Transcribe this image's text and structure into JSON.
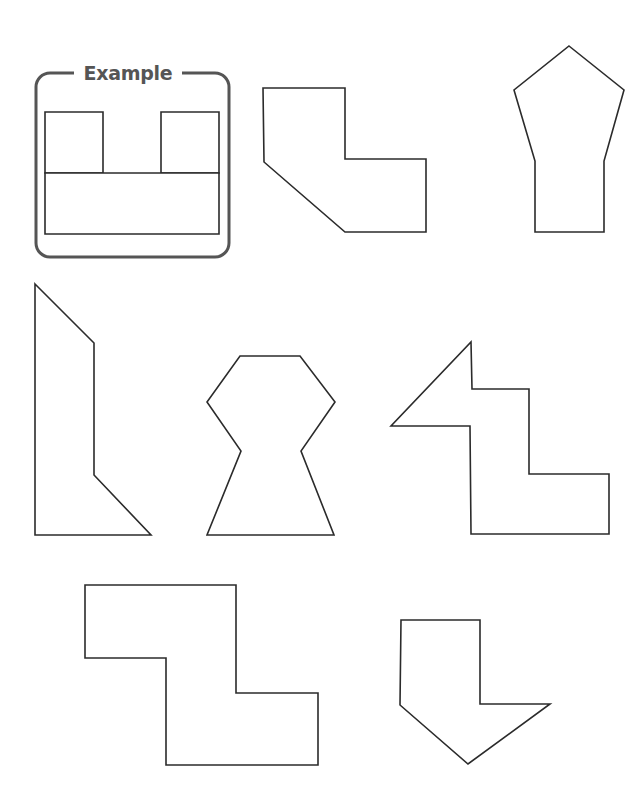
{
  "worksheet": {
    "example": {
      "title": "Example",
      "frame": {
        "x": 36,
        "y": 73,
        "width": 193,
        "height": 184,
        "radius": 14,
        "color": "#555555"
      },
      "pieces": [
        {
          "name": "left-square",
          "points": "45,112 103,112 103,173 45,173"
        },
        {
          "name": "right-square",
          "points": "161,112 219,112 219,173 161,173"
        },
        {
          "name": "bottom-rectangle",
          "points": "45,173 219,173 219,234 45,234"
        }
      ]
    },
    "shapes": [
      {
        "id": 1,
        "name": "shape-bent-l",
        "points": "263,88 345,88 345,159 426,159 426,232 345,232 264,162"
      },
      {
        "id": 2,
        "name": "shape-house",
        "points": "569,46 624,90 604,161 604,232 535,232 535,161 514,90"
      },
      {
        "id": 3,
        "name": "shape-tall-slant",
        "points": "35,284 94,343 94,475 151,535 35,535"
      },
      {
        "id": 4,
        "name": "shape-keyhole",
        "points": "240,356 300,356 335,402 301,451 334,535 207,535 241,451 207,402"
      },
      {
        "id": 5,
        "name": "shape-step-arrow",
        "points": "471,342 472,389 529,389 529,474 609,474 609,534 471,534 470,426 391,426"
      },
      {
        "id": 6,
        "name": "shape-z",
        "points": "85,585 236,585 236,693 318,693 318,765 166,765 166,658 85,658"
      },
      {
        "id": 7,
        "name": "shape-down-arrow",
        "points": "401,620 480,620 480,704 550,704 468,764 400,705"
      }
    ],
    "stroke_color": "#2b2b2b"
  }
}
